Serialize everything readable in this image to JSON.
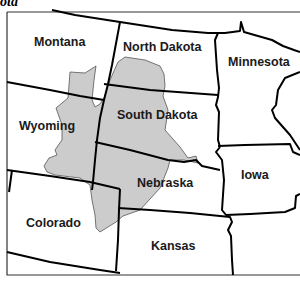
{
  "corner_label": "ota",
  "map": {
    "shaded_region_color": "#cccccc",
    "border_color": "#000000",
    "background": "#ffffff",
    "states": [
      {
        "name": "Montana",
        "x": 34,
        "y": 46
      },
      {
        "name": "North Dakota",
        "x": 123,
        "y": 51
      },
      {
        "name": "Minnesota",
        "x": 228,
        "y": 66
      },
      {
        "name": "Wyoming",
        "x": 19,
        "y": 130
      },
      {
        "name": "South Dakota",
        "x": 117,
        "y": 119
      },
      {
        "name": "Nebraska",
        "x": 137,
        "y": 187
      },
      {
        "name": "Iowa",
        "x": 241,
        "y": 179
      },
      {
        "name": "Colorado",
        "x": 26,
        "y": 227
      },
      {
        "name": "Kansas",
        "x": 151,
        "y": 250
      }
    ]
  }
}
